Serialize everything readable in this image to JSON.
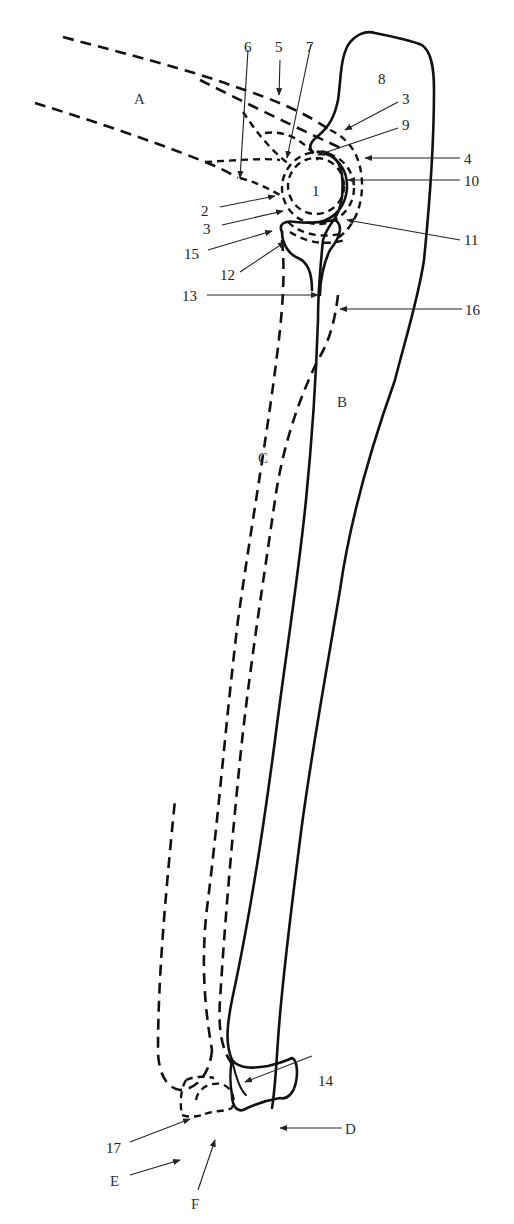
{
  "diagram": {
    "type": "anatomical line drawing",
    "stroke_color": "#111111",
    "background": "#ffffff",
    "region_labels": {
      "A": "A",
      "B": "B",
      "C": "C",
      "D": "D",
      "E": "E",
      "F": "F"
    },
    "numbered_labels": {
      "n1": "1",
      "n2": "2",
      "n3a": "3",
      "n3b": "3",
      "n4": "4",
      "n5": "5",
      "n6": "6",
      "n7": "7",
      "n8": "8",
      "n9": "9",
      "n10": "10",
      "n11": "11",
      "n12": "12",
      "n13": "13",
      "n14": "14",
      "n15": "15",
      "n16": "16",
      "n17": "17"
    }
  }
}
